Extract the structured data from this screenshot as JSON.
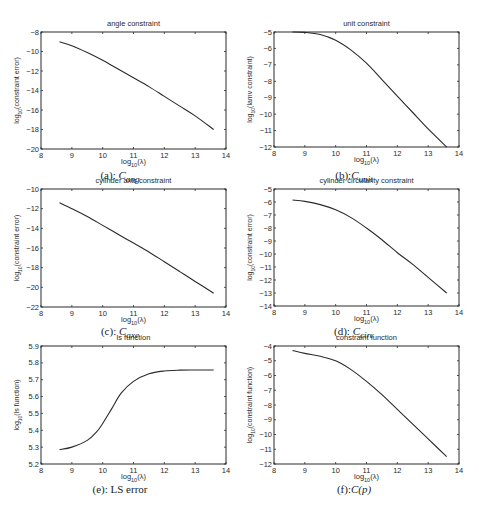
{
  "figure": {
    "panels": [
      {
        "id": "a",
        "caption_prefix": "(a): ",
        "caption_symbol": "C",
        "caption_sub": "ang"
      },
      {
        "id": "b",
        "caption_prefix": "(b):",
        "caption_symbol": "C",
        "caption_sub": "unit"
      },
      {
        "id": "c",
        "caption_prefix": "(c): ",
        "caption_symbol": "C",
        "caption_sub": "axe"
      },
      {
        "id": "d",
        "caption_prefix": "(d): ",
        "caption_symbol": "C",
        "caption_sub": "circ"
      },
      {
        "id": "e",
        "caption_prefix": "(e): LS error",
        "caption_symbol": "",
        "caption_sub": ""
      },
      {
        "id": "f",
        "caption_prefix": "(f):",
        "caption_symbol": "C(p)",
        "caption_sub": ""
      }
    ]
  },
  "chart_data": [
    {
      "type": "line",
      "title": "angle constraint",
      "xlabel": "log10(λ)",
      "ylabel": "log10(constraint error)",
      "xlim": [
        8,
        14
      ],
      "ylim": [
        -20,
        -8
      ],
      "xticks": [
        8,
        9,
        10,
        11,
        12,
        13,
        14
      ],
      "yticks": [
        -20,
        -18,
        -16,
        -14,
        -12,
        -10,
        -8
      ],
      "grid": false,
      "x": [
        8.6,
        9.0,
        9.5,
        10.0,
        10.5,
        11.0,
        11.5,
        12.0,
        12.5,
        13.0,
        13.6
      ],
      "y": [
        -9.0,
        -9.4,
        -10.1,
        -10.9,
        -11.8,
        -12.7,
        -13.6,
        -14.6,
        -15.6,
        -16.6,
        -18.0
      ]
    },
    {
      "type": "line",
      "title": "unit constraint",
      "xlabel": "log10(λ)",
      "ylabel": "log10(lamv constraint)",
      "xlim": [
        8,
        14
      ],
      "ylim": [
        -12,
        -5
      ],
      "xticks": [
        8,
        9,
        10,
        11,
        12,
        13,
        14
      ],
      "yticks": [
        -12,
        -11,
        -10,
        -9,
        -8,
        -7,
        -6,
        -5
      ],
      "grid": false,
      "x": [
        8.6,
        9.0,
        9.5,
        10.0,
        10.5,
        11.0,
        11.5,
        12.0,
        12.5,
        13.0,
        13.6
      ],
      "y": [
        -5.0,
        -5.02,
        -5.15,
        -5.5,
        -6.1,
        -6.9,
        -7.9,
        -8.9,
        -9.9,
        -10.9,
        -12.0
      ]
    },
    {
      "type": "line",
      "title": "cylinder axis constraint",
      "xlabel": "log10(λ)",
      "ylabel": "log10(constraint error)",
      "xlim": [
        8,
        14
      ],
      "ylim": [
        -22,
        -10
      ],
      "xticks": [
        8,
        9,
        10,
        11,
        12,
        13,
        14
      ],
      "yticks": [
        -22,
        -20,
        -18,
        -16,
        -14,
        -12,
        -10
      ],
      "grid": false,
      "x": [
        8.6,
        9.0,
        9.5,
        10.0,
        10.5,
        11.0,
        11.5,
        12.0,
        12.5,
        13.0,
        13.6
      ],
      "y": [
        -11.4,
        -12.0,
        -12.8,
        -13.7,
        -14.6,
        -15.5,
        -16.4,
        -17.4,
        -18.4,
        -19.4,
        -20.6
      ]
    },
    {
      "type": "line",
      "title": "cylinder circularity constraint",
      "xlabel": "log10(λ)",
      "ylabel": "log10(constraint error)",
      "xlim": [
        8,
        14
      ],
      "ylim": [
        -14,
        -5
      ],
      "xticks": [
        8,
        9,
        10,
        11,
        12,
        13,
        14
      ],
      "yticks": [
        -14,
        -13,
        -12,
        -11,
        -10,
        -9,
        -8,
        -7,
        -6,
        -5
      ],
      "grid": false,
      "x": [
        8.6,
        9.0,
        9.5,
        10.0,
        10.5,
        11.0,
        11.5,
        12.0,
        12.5,
        13.0,
        13.6
      ],
      "y": [
        -5.85,
        -5.95,
        -6.2,
        -6.6,
        -7.2,
        -8.0,
        -8.9,
        -9.9,
        -10.8,
        -11.8,
        -13.0
      ]
    },
    {
      "type": "line",
      "title": "ls function",
      "xlabel": "log10(λ)",
      "ylabel": "log10(ls function)",
      "xlim": [
        8,
        14
      ],
      "ylim": [
        5.2,
        5.9
      ],
      "xticks": [
        8,
        9,
        10,
        11,
        12,
        13,
        14
      ],
      "yticks": [
        5.2,
        5.3,
        5.4,
        5.5,
        5.6,
        5.7,
        5.8,
        5.9
      ],
      "grid": false,
      "x": [
        8.6,
        9.0,
        9.5,
        9.8,
        10.0,
        10.3,
        10.6,
        11.0,
        11.5,
        12.0,
        12.5,
        13.0,
        13.6
      ],
      "y": [
        5.285,
        5.3,
        5.34,
        5.39,
        5.44,
        5.53,
        5.62,
        5.69,
        5.735,
        5.752,
        5.757,
        5.758,
        5.758
      ]
    },
    {
      "type": "line",
      "title": "constraint function",
      "xlabel": "log10(λ)",
      "ylabel": "log10(constraint function)",
      "xlim": [
        8,
        14
      ],
      "ylim": [
        -12,
        -4
      ],
      "xticks": [
        8,
        9,
        10,
        11,
        12,
        13,
        14
      ],
      "yticks": [
        -12,
        -11,
        -10,
        -9,
        -8,
        -7,
        -6,
        -5,
        -4
      ],
      "grid": false,
      "x": [
        8.6,
        9.0,
        9.5,
        10.0,
        10.5,
        11.0,
        11.5,
        12.0,
        12.5,
        13.0,
        13.6
      ],
      "y": [
        -4.3,
        -4.5,
        -4.7,
        -5.0,
        -5.6,
        -6.4,
        -7.3,
        -8.3,
        -9.3,
        -10.3,
        -11.5
      ]
    }
  ]
}
